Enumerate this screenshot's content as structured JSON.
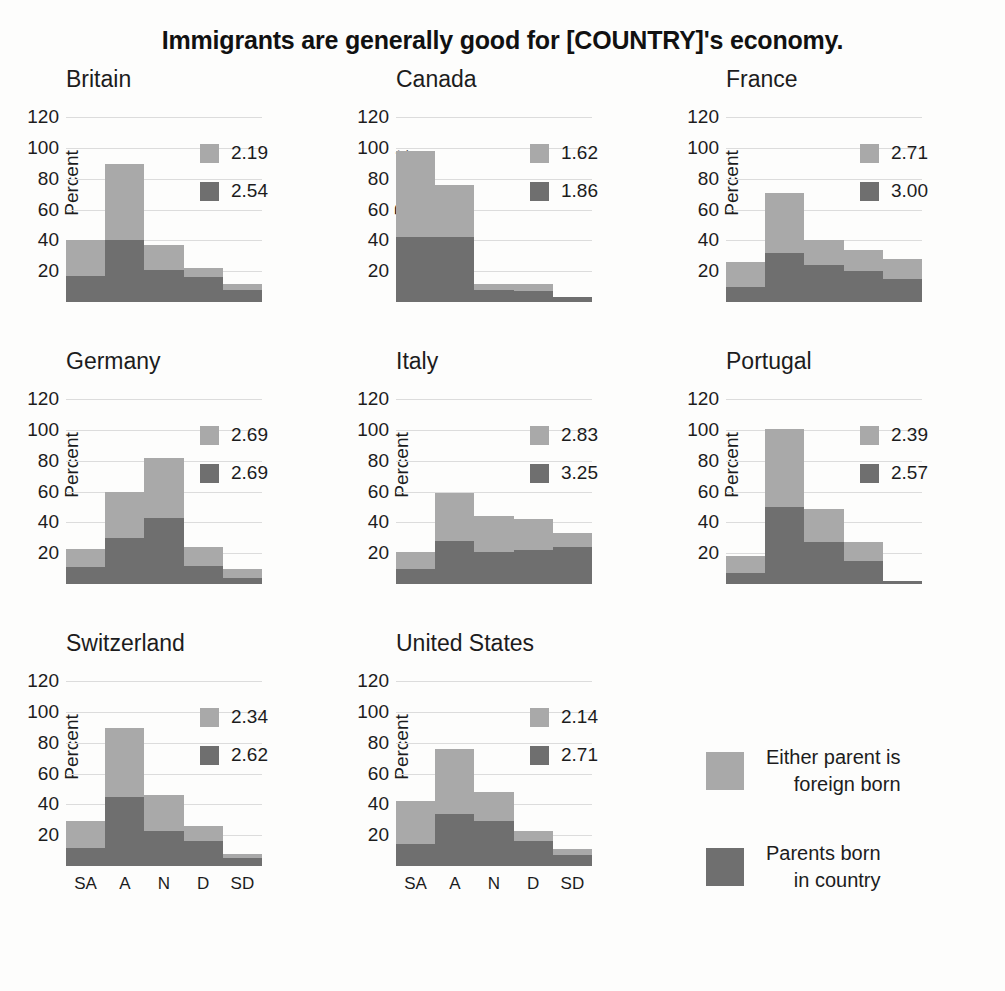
{
  "title": "Immigrants are generally good for [COUNTRY]'s economy.",
  "axis": {
    "ylabel": "Percent",
    "yticks": [
      20,
      40,
      60,
      80,
      100,
      120
    ],
    "ylim": [
      0,
      130
    ],
    "xticks": [
      "SA",
      "A",
      "N",
      "D",
      "SD"
    ]
  },
  "colors": {
    "light": "#a9a9a9",
    "dark": "#6f6f6f",
    "grid": "#dcdcdc",
    "text": "#1c1c1c"
  },
  "legend": {
    "position": "bottom-right",
    "items": [
      {
        "label": "Either parent is\nforeign born",
        "color": "#a9a9a9",
        "icon": "legend-swatch-light"
      },
      {
        "label": "Parents born\nin country",
        "color": "#6f6f6f",
        "icon": "legend-swatch-dark"
      }
    ]
  },
  "chart_data": {
    "type": "bar",
    "subtype": "stacked-bar-small-multiples",
    "title": "Immigrants are generally good for [COUNTRY]'s economy.",
    "xlabel": "",
    "ylabel": "Percent",
    "ylim": [
      0,
      130
    ],
    "yticks": [
      20,
      40,
      60,
      80,
      100,
      120
    ],
    "grid": true,
    "categories": [
      "SA",
      "A",
      "N",
      "D",
      "SD"
    ],
    "series_names": [
      "Either parent is foreign born",
      "Parents born in country"
    ],
    "panels": [
      {
        "name": "Britain",
        "means": {
          "foreign_born": "2.19",
          "native_born": "2.54"
        },
        "dark_values": [
          17,
          40,
          21,
          16,
          8
        ],
        "total_values": [
          40,
          90,
          37,
          22,
          12
        ]
      },
      {
        "name": "Canada",
        "means": {
          "foreign_born": "1.62",
          "native_born": "1.86"
        },
        "dark_values": [
          42,
          42,
          8,
          7,
          3
        ],
        "total_values": [
          98,
          76,
          12,
          12,
          3
        ]
      },
      {
        "name": "France",
        "means": {
          "foreign_born": "2.71",
          "native_born": "3.00"
        },
        "dark_values": [
          10,
          32,
          24,
          20,
          15
        ],
        "total_values": [
          26,
          71,
          40,
          34,
          28
        ]
      },
      {
        "name": "Germany",
        "means": {
          "foreign_born": "2.69",
          "native_born": "2.69"
        },
        "dark_values": [
          11,
          30,
          43,
          12,
          4
        ],
        "total_values": [
          23,
          60,
          82,
          24,
          10
        ]
      },
      {
        "name": "Italy",
        "means": {
          "foreign_born": "2.83",
          "native_born": "3.25"
        },
        "dark_values": [
          10,
          28,
          21,
          22,
          24
        ],
        "total_values": [
          21,
          59,
          44,
          42,
          33
        ]
      },
      {
        "name": "Portugal",
        "means": {
          "foreign_born": "2.39",
          "native_born": "2.57"
        },
        "dark_values": [
          7,
          50,
          27,
          15,
          2
        ],
        "total_values": [
          18,
          101,
          49,
          27,
          2
        ]
      },
      {
        "name": "Switzerland",
        "means": {
          "foreign_born": "2.34",
          "native_born": "2.62"
        },
        "dark_values": [
          12,
          45,
          23,
          16,
          5
        ],
        "total_values": [
          29,
          90,
          46,
          26,
          8
        ]
      },
      {
        "name": "United States",
        "means": {
          "foreign_born": "2.14",
          "native_born": "2.71"
        },
        "dark_values": [
          14,
          34,
          29,
          16,
          7
        ],
        "total_values": [
          42,
          76,
          48,
          23,
          11
        ]
      }
    ]
  }
}
